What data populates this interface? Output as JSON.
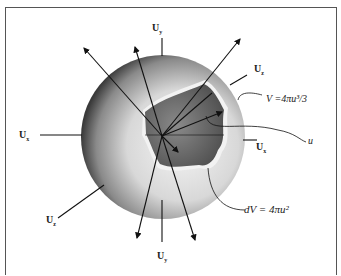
{
  "diagram": {
    "labels": {
      "uy_top": "U",
      "uy_top_sub": "y",
      "uz_top": "U",
      "uz_top_sub": "z",
      "volume": "V =4πu³/3",
      "radius": "u",
      "ux_right": "U",
      "ux_right_sub": "x",
      "ux_left": "U",
      "ux_left_sub": "x",
      "uz_bottom": "U",
      "uz_bottom_sub": "z",
      "shell": "dV = 4πu²",
      "uy_bottom": "U",
      "uy_bottom_sub": "y"
    },
    "colors": {
      "sphere_dark": "#2a2a2a",
      "sphere_light": "#e6e6e6",
      "cutaway": "#6a6a6a",
      "line": "#111111"
    }
  }
}
